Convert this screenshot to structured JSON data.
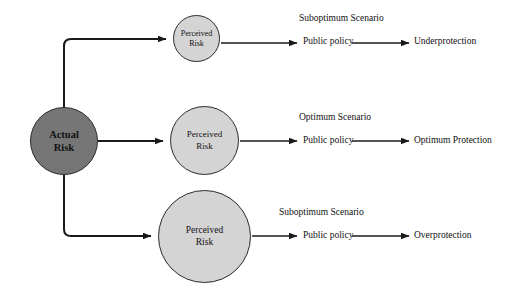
{
  "diagram": {
    "background_color": "#ffffff",
    "line_color": "#1a1a1a"
  },
  "source_node": {
    "label_line1": "Actual",
    "label_line2": "Risk",
    "fill_color": "#767676"
  },
  "branches": [
    {
      "node": {
        "label_line1": "Perceived",
        "label_line2": "Risk",
        "fill_color": "#d4d4d4",
        "size": "small"
      },
      "scenario": "Suboptimum Scenario",
      "policy": "Public policy",
      "outcome": "Underprotection"
    },
    {
      "node": {
        "label_line1": "Perceived",
        "label_line2": "Risk",
        "fill_color": "#d4d4d4",
        "size": "medium"
      },
      "scenario": "Optimum Scenario",
      "policy": "Public policy",
      "outcome": "Optimum Protection"
    },
    {
      "node": {
        "label_line1": "Perceived",
        "label_line2": "Risk",
        "fill_color": "#d4d4d4",
        "size": "large"
      },
      "scenario": "Suboptimum Scenario",
      "policy": "Public policy",
      "outcome": "Overprotection"
    }
  ]
}
